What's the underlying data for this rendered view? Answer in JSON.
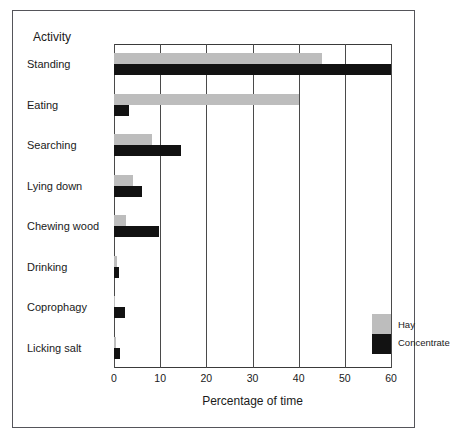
{
  "chart_data": {
    "type": "bar",
    "orientation": "horizontal",
    "title": "",
    "xlabel": "Percentage of time",
    "ylabel": "Activity",
    "categories": [
      "Standing",
      "Eating",
      "Searching",
      "Lying down",
      "Chewing wood",
      "Drinking",
      "Coprophagy",
      "Licking salt"
    ],
    "series": [
      {
        "name": "Hay",
        "color": "#bdbdbd",
        "values": [
          45,
          40,
          8.3,
          4.2,
          2.6,
          0.6,
          0.3,
          0.5
        ]
      },
      {
        "name": "Concentrate",
        "color": "#121212",
        "values": [
          60,
          3.2,
          14.5,
          6.0,
          9.8,
          1.1,
          2.4,
          1.2
        ]
      }
    ],
    "xlim": [
      0,
      60
    ],
    "xticks": [
      0,
      10,
      20,
      30,
      40,
      50,
      60
    ],
    "xtick_labels": [
      "0",
      "10",
      "20",
      "30",
      "40",
      "50",
      "60"
    ],
    "grid": true,
    "grid_axis": "x",
    "legend_position": "center-right",
    "legend_entries": [
      "Hay",
      "Concentrate"
    ]
  },
  "axis": {
    "category_header": "Activity",
    "x_title": "Percentage of time"
  }
}
